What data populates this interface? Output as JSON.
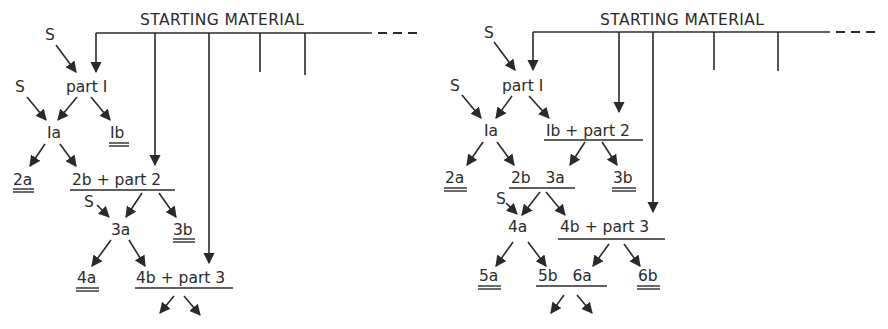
{
  "figure": {
    "colors": {
      "ink": "#2a2a2a",
      "background": "#ffffff"
    },
    "schemes": [
      {
        "id": "left",
        "header": "STARTING MATERIAL",
        "reagent_label": "S",
        "nodes": {
          "part1": "part I",
          "n1a": "Ia",
          "n1b": "Ib",
          "n2a": "2a",
          "n2b_part2": "2b + part 2",
          "n3a": "3a",
          "n3b": "3b",
          "n4a": "4a",
          "n4b_part3": "4b + part 3"
        },
        "double_underlined": [
          "Ib",
          "2a",
          "3b",
          "4a"
        ]
      },
      {
        "id": "right",
        "header": "STARTING MATERIAL",
        "reagent_label": "S",
        "nodes": {
          "part1": "part I",
          "n1a": "Ia",
          "n1b_part2": "Ib + part 2",
          "n2a": "2a",
          "n2b_3a": "2b   3a",
          "n3b": "3b",
          "n4a": "4a",
          "n4b_part3": "4b + part 3",
          "n5a": "5a",
          "n5b_6a": "5b   6a",
          "n6b": "6b"
        },
        "double_underlined": [
          "2a",
          "3b",
          "5a",
          "6b"
        ]
      }
    ]
  }
}
